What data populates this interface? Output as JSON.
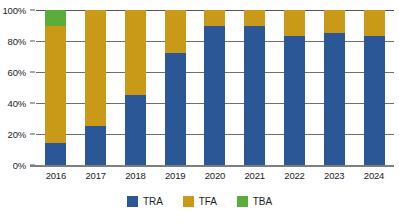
{
  "chart_data": {
    "type": "bar",
    "stacked": true,
    "stack_mode": "percent",
    "title": "",
    "subtitle": "",
    "xlabel": "",
    "ylabel": "",
    "ylim": [
      0,
      100
    ],
    "yticks": [
      0,
      20,
      40,
      60,
      80,
      100
    ],
    "ytick_labels": [
      "0%",
      "20%",
      "40%",
      "60%",
      "80%",
      "100%"
    ],
    "grid": true,
    "legend_position": "bottom",
    "categories": [
      "2016",
      "2017",
      "2018",
      "2019",
      "2020",
      "2021",
      "2022",
      "2023",
      "2024"
    ],
    "series": [
      {
        "name": "TRA",
        "color": "#2B5797",
        "values": [
          14,
          25,
          45,
          72,
          90,
          90,
          83,
          85,
          83
        ]
      },
      {
        "name": "TFA",
        "color": "#C89A18",
        "values": [
          76,
          75,
          55,
          28,
          10,
          10,
          17,
          15,
          17
        ]
      },
      {
        "name": "TBA",
        "color": "#5BAD3A",
        "values": [
          10,
          0,
          0,
          0,
          0,
          0,
          0,
          0,
          0
        ]
      }
    ],
    "legend": [
      {
        "label": "TRA",
        "color": "#2B5797"
      },
      {
        "label": "TFA",
        "color": "#C89A18"
      },
      {
        "label": "TBA",
        "color": "#5BAD3A"
      }
    ]
  },
  "colors": {
    "tra": "#2B5797",
    "tfa": "#C89A18",
    "tba": "#5BAD3A",
    "gridline": "#6e6f73",
    "axis": "#7d7e82",
    "text": "#1c1c1c",
    "background": "#ffffff"
  }
}
